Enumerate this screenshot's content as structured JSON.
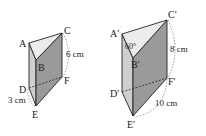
{
  "figure_left": {
    "vertices": {
      "A": "A",
      "B": "B",
      "C": "C",
      "D": "D",
      "E": "E",
      "F": "F"
    },
    "labels": {
      "height": "6 cm",
      "base_edge": "3 cm"
    }
  },
  "figure_right": {
    "vertices": {
      "A": "A′",
      "B": "B′",
      "C": "C′",
      "D": "D′",
      "E": "E′",
      "F": "F′"
    },
    "labels": {
      "angle": "60°",
      "height": "8 cm",
      "base_edge": "10 cm"
    }
  },
  "colors": {
    "top_face": "#e8e8e8",
    "left_face": "#cfcfcf",
    "front_face": "#9a9a9a",
    "edge": "#222222"
  }
}
